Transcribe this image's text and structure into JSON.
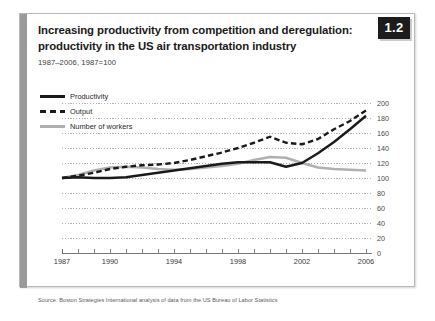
{
  "figure": {
    "badge": "1.2",
    "title": "Increasing productivity from competition and deregulation: productivity in the US air transportation industry",
    "subtitle": "1987–2006, 1987=100",
    "source": "Source: Boston Strategies International analysis of data from the US Bureau of Labor Statistics"
  },
  "colors": {
    "productivity": "#1a1a1a",
    "output": "#1a1a1a",
    "workers": "#b0b0b0",
    "badge_bg": "#1c1c1c",
    "accent_bar": "#9a9a9a",
    "grid": "#9e9e9e",
    "axis": "#6a6a6a",
    "card_border": "#b8b8b8"
  },
  "legend": {
    "position": "top-left",
    "items": [
      {
        "label": "Productivity",
        "style": "solid-dark"
      },
      {
        "label": "Output",
        "style": "dashed-dark"
      },
      {
        "label": "Number of workers",
        "style": "solid-gray"
      }
    ]
  },
  "chart_data": {
    "type": "line",
    "title": "Increasing productivity from competition and deregulation: productivity in the US air transportation industry",
    "subtitle": "1987–2006, 1987=100",
    "xlabel": "",
    "ylabel": "",
    "ylim": [
      0,
      200
    ],
    "yticks": [
      0,
      20,
      40,
      60,
      80,
      100,
      120,
      140,
      160,
      180,
      200
    ],
    "xlim": [
      1987,
      2006
    ],
    "xticks": [
      1987,
      1988,
      1989,
      1990,
      1991,
      1992,
      1993,
      1994,
      1995,
      1996,
      1997,
      1998,
      1999,
      2000,
      2001,
      2002,
      2003,
      2004,
      2005,
      2006
    ],
    "xtick_labels": [
      "1987",
      "",
      "",
      "1990",
      "",
      "",
      "",
      "1994",
      "",
      "",
      "",
      "1998",
      "",
      "",
      "",
      "2002",
      "",
      "",
      "",
      "2006"
    ],
    "grid": true,
    "grid_axis": "y",
    "legend_position": "top-left",
    "x": [
      1987,
      1988,
      1989,
      1990,
      1991,
      1992,
      1993,
      1994,
      1995,
      1996,
      1997,
      1998,
      1999,
      2000,
      2001,
      2002,
      2003,
      2004,
      2005,
      2006
    ],
    "series": [
      {
        "name": "Productivity",
        "style": "solid",
        "color": "#1a1a1a",
        "values": [
          100,
          101,
          100,
          100,
          101,
          104,
          107,
          110,
          113,
          116,
          119,
          121,
          121,
          121,
          115,
          120,
          133,
          148,
          165,
          183
        ]
      },
      {
        "name": "Output",
        "style": "dashed",
        "color": "#1a1a1a",
        "values": [
          100,
          103,
          107,
          112,
          115,
          117,
          118,
          120,
          124,
          129,
          134,
          140,
          147,
          155,
          147,
          145,
          152,
          165,
          176,
          190
        ]
      },
      {
        "name": "Number of workers",
        "style": "solid",
        "color": "#b0b0b0",
        "values": [
          100,
          104,
          110,
          114,
          115,
          114,
          112,
          111,
          112,
          114,
          116,
          119,
          124,
          128,
          127,
          120,
          114,
          112,
          111,
          110
        ]
      }
    ]
  }
}
